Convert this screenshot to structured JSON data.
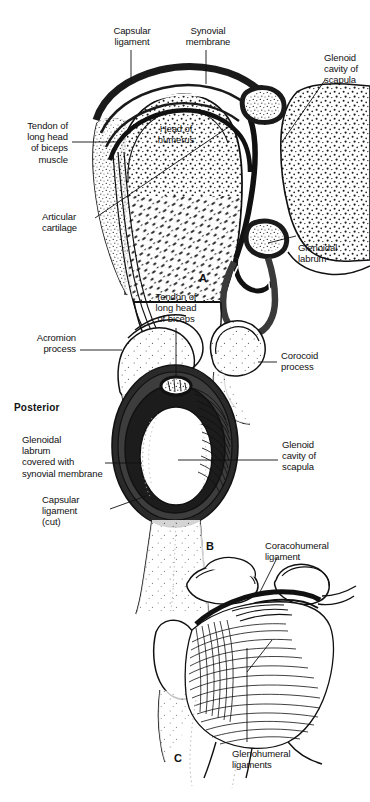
{
  "figure": {
    "panels": [
      {
        "letter": "A",
        "name": "coronal-section",
        "labels": [
          {
            "id": "capsular-ligament-a",
            "text": "Capsular\nligament"
          },
          {
            "id": "synovial-membrane-a",
            "text": "Synovial\nmembrane"
          },
          {
            "id": "glenoid-cavity-a",
            "text": "Glenoid\ncavity of\nscapula"
          },
          {
            "id": "tendon-biceps-a",
            "text": "Tendon of\nlong head\nof biceps\nmuscle"
          },
          {
            "id": "head-of-humerus-a",
            "text": "Head of\nhumerus"
          },
          {
            "id": "articular-cartilage-a",
            "text": "Articular\ncartilage"
          },
          {
            "id": "glenoidal-labrum-a",
            "text": "Glenoidal\nlabrum"
          }
        ]
      },
      {
        "letter": "B",
        "name": "lateral-view-glenoid",
        "labels": [
          {
            "id": "tendon-biceps-b",
            "text": "Tendon of\nlong head\nof biceps"
          },
          {
            "id": "acromion-process-b",
            "text": "Acromion\nprocess"
          },
          {
            "id": "corocoid-process-b",
            "text": "Corocoid\nprocess"
          },
          {
            "id": "posterior-b",
            "text": "Posterior"
          },
          {
            "id": "glenoidal-labrum-b",
            "text": "Glenoidal\nlabrum\ncovered with\nsynovial membrane"
          },
          {
            "id": "glenoid-cavity-b",
            "text": "Glenoid\ncavity of\nscapula"
          },
          {
            "id": "capsular-ligament-b",
            "text": "Capsular\nligament\n(cut)"
          }
        ]
      },
      {
        "letter": "C",
        "name": "anterior-view-ligaments",
        "labels": [
          {
            "id": "coracohumeral-ligament-c",
            "text": "Coracohumeral\nligament"
          },
          {
            "id": "glenohumeral-ligaments-c",
            "text": "Glenohumeral\nligaments"
          }
        ]
      }
    ]
  },
  "colors": {
    "ink": "#111111",
    "bone_fill": "#ffffff",
    "capsule_dark": "#1a1a1a",
    "labrum_gray": "#4a4a4a",
    "background": "#ffffff"
  }
}
